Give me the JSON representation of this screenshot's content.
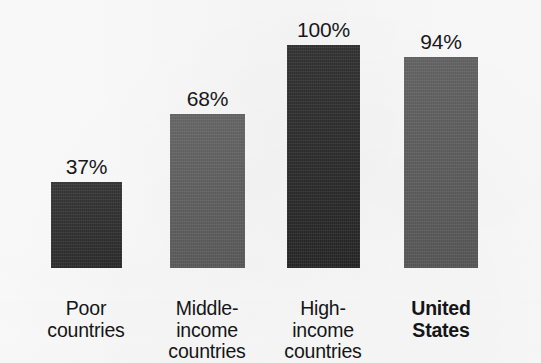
{
  "chart_data": {
    "type": "bar",
    "title": "",
    "subtitle": "",
    "xlabel": "",
    "ylabel": "",
    "ylim": [
      0,
      100
    ],
    "grid": false,
    "legend": "none",
    "categories": [
      "Poor countries",
      "Middle-income countries",
      "High-income countries",
      "United States"
    ],
    "category_lines": [
      [
        "Poor",
        "countries"
      ],
      [
        "Middle-",
        "income",
        "countries"
      ],
      [
        "High-",
        "income",
        "countries"
      ],
      [
        "United",
        "States"
      ]
    ],
    "values": [
      37,
      68,
      100,
      94
    ],
    "value_labels": [
      "37%",
      "68%",
      "100%",
      "94%"
    ],
    "bar_colors": [
      "#2b2b2b",
      "#5b5b5b",
      "#262626",
      "#585858"
    ],
    "emphasis": [
      false,
      false,
      false,
      true
    ],
    "background_color": "#fcfcfc",
    "text_color": "#151517"
  },
  "bars": [
    {
      "value_label": "37%",
      "lines": [
        "Poor",
        "countries"
      ],
      "color": "#2b2b2b",
      "left": "51px",
      "width": "71px",
      "height": "86px",
      "label_left": "22px",
      "label_width": "128px",
      "bold": false
    },
    {
      "value_label": "68%",
      "lines": [
        "Middle-",
        "income",
        "countries"
      ],
      "color": "#5b5b5b",
      "left": "170px",
      "width": "75px",
      "height": "154px",
      "label_left": "143px",
      "label_width": "128px",
      "bold": false
    },
    {
      "value_label": "100%",
      "lines": [
        "High-",
        "income",
        "countries"
      ],
      "color": "#262626",
      "left": "287px",
      "width": "73px",
      "height": "223px",
      "label_left": "259px",
      "label_width": "128px",
      "bold": false
    },
    {
      "value_label": "94%",
      "lines": [
        "United",
        "States"
      ],
      "color": "#585858",
      "left": "404px",
      "width": "74px",
      "height": "211px",
      "label_left": "377px",
      "label_width": "128px",
      "bold": true
    }
  ]
}
